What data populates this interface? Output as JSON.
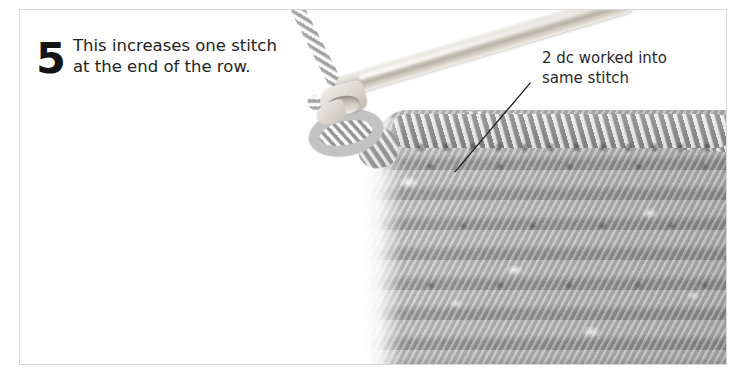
{
  "page": {
    "background_color": "#ffffff",
    "frame_border_color": "#d8d8d8"
  },
  "step": {
    "number": "5",
    "text_line_1": "This increases one stitch",
    "text_line_2": "at the end of the row.",
    "text_color": "#232323",
    "number_color": "#141414"
  },
  "callout": {
    "line_1": "2 dc worked into",
    "line_2": "same stitch",
    "text_color": "#2a2a2a",
    "leader_line_color": "#1c1c1c",
    "leader_from_x": 455,
    "leader_from_y": 172,
    "leader_to_x": 531,
    "leader_to_y": 82
  },
  "photo": {
    "subject": "crochet-swatch-with-hook",
    "yarn_color": "#9a9a9a",
    "hook_color": "#d9d5cd",
    "fabric_highlight_color": "#d0d0d0",
    "fabric_shadow_color": "#5a5a5a"
  }
}
